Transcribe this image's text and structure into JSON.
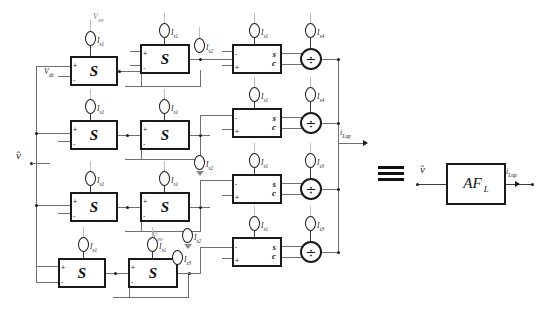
{
  "diagram": {
    "input_label": "v̂",
    "output_label": "i",
    "output_sub": "Lup",
    "equivalence_symbol": "≡",
    "block_s_glyph": "S",
    "block_sc_numerator": "s",
    "block_sc_denominator": "c",
    "divider_glyph": "÷",
    "af_label": "AF",
    "af_sub": "L",
    "terminal_plus": "+",
    "terminal_minus": "-",
    "v_dc_label": "V",
    "v_dc_sub": "dc",
    "v_sw_label": "V",
    "v_sw_sub": "sw"
  },
  "rows": [
    {
      "id": "row-1",
      "s1_label": "I",
      "s1_sub": "s1",
      "s2_label": "I",
      "s2_sub": "s1",
      "mid_label": "I",
      "mid_sub": "s2",
      "sc_label": "I",
      "sc_sub": "s1",
      "div_label": "I",
      "div_sub": "s4",
      "top_source_label": "V",
      "top_source_sub": "sw",
      "input_label": "V",
      "input_sub": "dc"
    },
    {
      "id": "row-2",
      "s1_label": "I",
      "s1_sub": "s1",
      "s2_label": "I",
      "s2_sub": "s1",
      "mid_label": "I",
      "mid_sub": "s2",
      "sc_label": "I",
      "sc_sub": "s1",
      "div_label": "I",
      "div_sub": "s4"
    },
    {
      "id": "row-3",
      "s1_label": "I",
      "s1_sub": "s1",
      "s2_label": "I",
      "s2_sub": "s1",
      "mid_label": "I",
      "mid_sub": "s2",
      "sc_label": "I",
      "sc_sub": "s1",
      "div_label": "I",
      "div_sub": "s3",
      "bottom_label": "V",
      "bottom_sub": "sw"
    },
    {
      "id": "row-4",
      "s1_label": "I",
      "s1_sub": "s1",
      "s2_label": "I",
      "s2_sub": "s1",
      "mid_label": "I",
      "mid_sub": "s2",
      "mid2_label": "I",
      "mid2_sub": "s3",
      "sc_label": "I",
      "sc_sub": "s1",
      "div_label": "I",
      "div_sub": "s3"
    }
  ],
  "equivalent": {
    "input_label": "v̂",
    "block_label": "AF",
    "block_sub": "L",
    "output_label": "i",
    "output_sub": "Lup"
  }
}
